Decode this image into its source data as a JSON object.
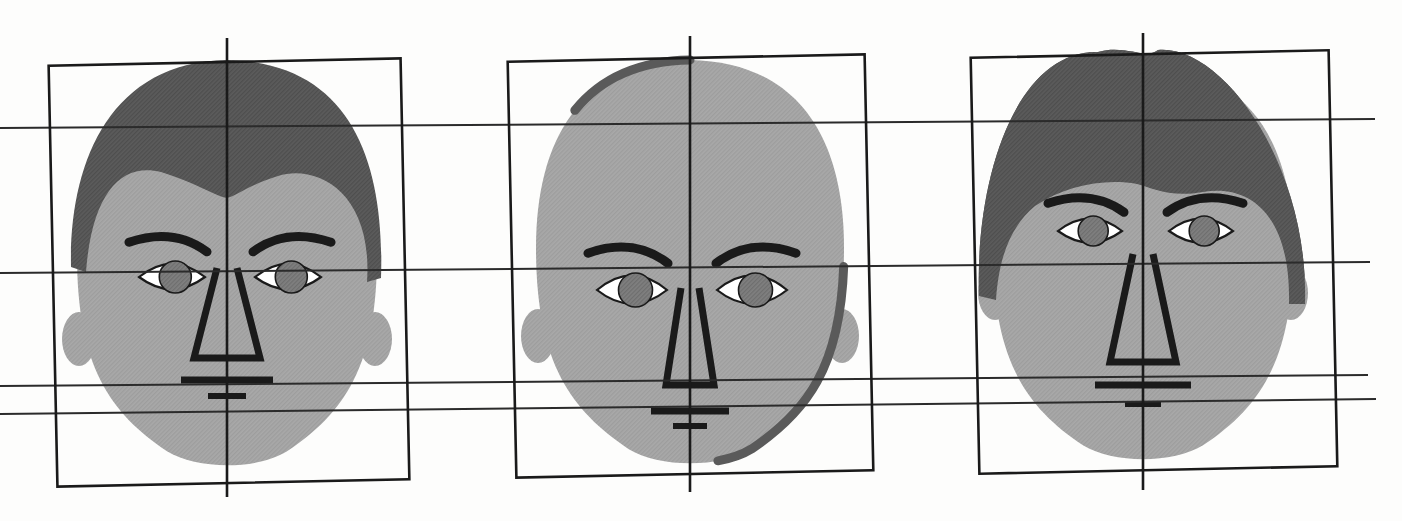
{
  "figure": {
    "canvas": {
      "width": 1402,
      "height": 521,
      "background": "#fdfdfc"
    }
  },
  "palette": {
    "ink": "#1a1a1a",
    "grid_line": "#2b2b2b",
    "skin": "#a9a9a9",
    "skin_shadow": "#9a9a9a",
    "hair_dark": "#5a5a5a",
    "hair_darker": "#4a4a4a",
    "eye_white": "#ffffff",
    "iris": "#7b7b7b",
    "paper": "#fdfdfc"
  },
  "grid": {
    "label": "proportion-guides",
    "horizontal_lines": [
      {
        "name": "hairline-guide",
        "index": 1,
        "y_left": 128,
        "y_right": 119,
        "x_start": 0,
        "x_end": 1375
      },
      {
        "name": "brow-eye-guide",
        "index": 2,
        "y_left": 273,
        "y_right": 262,
        "x_start": 0,
        "x_end": 1370
      },
      {
        "name": "nose-base-guide",
        "index": 3,
        "y_left": 386,
        "y_right": 375,
        "x_start": 0,
        "x_end": 1368
      },
      {
        "name": "mouth-guide",
        "index": 4,
        "y_left": 414,
        "y_right": 399,
        "x_start": 0,
        "x_end": 1376
      }
    ],
    "stroke_width": 2.0
  },
  "faces": [
    {
      "id": "face-left",
      "label": "Face 1 — receding hairline, broad jaw",
      "box": {
        "x": 53,
        "y": 62,
        "width": 352,
        "height": 421,
        "tilt": -1.2
      },
      "axis": {
        "x": 227,
        "y_top": 38,
        "y_bottom": 497
      },
      "center_x": 227,
      "hair_style": "receding-m-hairline",
      "head_width": 300,
      "head_top": 72,
      "chin_y": 470,
      "eyes": {
        "y": 277,
        "left_x": 172,
        "right_x": 288,
        "rx": 33,
        "ry": 17,
        "iris_r": 16
      },
      "brows": {
        "y": 243,
        "left_x": 172,
        "right_x": 288,
        "width": 78,
        "arc": 16
      },
      "nose": {
        "top_y": 268,
        "base_y": 358,
        "top_half_width": 10,
        "base_half_width": 33
      },
      "mouth": {
        "y": 380,
        "width": 92,
        "thickness": 7
      },
      "lower_lip": {
        "y": 396,
        "width": 38,
        "thickness": 6
      }
    },
    {
      "id": "face-center",
      "label": "Face 2 — bald, egg-shaped cranium",
      "box": {
        "x": 512,
        "y": 58,
        "width": 357,
        "height": 416,
        "tilt": -1.2
      },
      "axis": {
        "x": 690,
        "y_top": 36,
        "y_bottom": 492
      },
      "center_x": 690,
      "hair_style": "bald",
      "head_width": 308,
      "head_top": 60,
      "chin_y": 468,
      "eyes": {
        "y": 290,
        "left_x": 632,
        "right_x": 752,
        "rx": 35,
        "ry": 19,
        "iris_r": 17
      },
      "brows": {
        "y": 254,
        "left_x": 632,
        "right_x": 752,
        "width": 80,
        "arc": 17
      },
      "nose": {
        "top_y": 288,
        "base_y": 385,
        "top_half_width": 9,
        "base_half_width": 24
      },
      "mouth": {
        "y": 411,
        "width": 78,
        "thickness": 7
      },
      "lower_lip": {
        "y": 426,
        "width": 34,
        "thickness": 6
      }
    },
    {
      "id": "face-right",
      "label": "Face 3 — thick dark hair, long nose",
      "box": {
        "x": 975,
        "y": 54,
        "width": 358,
        "height": 416,
        "tilt": -1.2
      },
      "axis": {
        "x": 1143,
        "y_top": 33,
        "y_bottom": 490
      },
      "center_x": 1143,
      "hair_style": "thick-dark-wavy",
      "head_width": 300,
      "head_top": 66,
      "chin_y": 464,
      "eyes": {
        "y": 231,
        "left_x": 1090,
        "right_x": 1201,
        "rx": 32,
        "ry": 16,
        "iris_r": 15
      },
      "brows": {
        "y": 204,
        "left_x": 1090,
        "right_x": 1201,
        "width": 76,
        "arc": 15
      },
      "nose": {
        "top_y": 254,
        "base_y": 362,
        "top_half_width": 10,
        "base_half_width": 33
      },
      "mouth": {
        "y": 385,
        "width": 96,
        "thickness": 7
      },
      "lower_lip": {
        "y": 404,
        "width": 36,
        "thickness": 6
      }
    }
  ]
}
